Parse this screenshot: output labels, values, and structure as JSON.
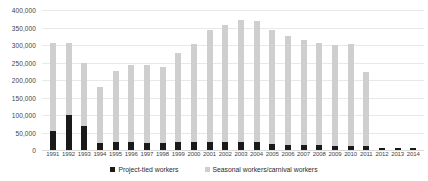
{
  "chart_data": {
    "type": "bar",
    "subtype": "stacked-column",
    "title": "",
    "subtitle": "",
    "xlabel": "",
    "ylabel": "",
    "ylim": [
      0,
      400000
    ],
    "ytick_step": 50000,
    "grid": true,
    "legend_position": "bottom",
    "categories": [
      "1991",
      "1992",
      "1993",
      "1994",
      "1995",
      "1996",
      "1997",
      "1998",
      "1999",
      "2000",
      "2001",
      "2002",
      "2003",
      "2004",
      "2005",
      "2006",
      "2007",
      "2008",
      "2009",
      "2010",
      "2011",
      "2012",
      "2013",
      "2014"
    ],
    "ytick_labels": [
      "400,000",
      "350,000",
      "300,000",
      "250,000",
      "200,000",
      "150,000",
      "100,000",
      "50,000",
      "0"
    ],
    "ytick_values": [
      400000,
      350000,
      300000,
      250000,
      200000,
      150000,
      100000,
      50000,
      0
    ],
    "series": [
      {
        "name": "Project-tied workers",
        "color": "#1a1a1a",
        "values": [
          53000,
          100000,
          70000,
          20000,
          22000,
          22000,
          21000,
          21000,
          22000,
          24000,
          24000,
          24000,
          24000,
          23000,
          18000,
          15000,
          14000,
          13000,
          12000,
          12000,
          11000,
          7000,
          6000,
          5000
        ]
      },
      {
        "name": "Seasonal workers/carnival workers",
        "color": "#cfcfcf",
        "values": [
          252000,
          205000,
          180000,
          160000,
          205000,
          222000,
          222000,
          215000,
          255000,
          280000,
          320000,
          332000,
          348000,
          345000,
          325000,
          310000,
          300000,
          292000,
          288000,
          292000,
          213000,
          0,
          0,
          0
        ]
      }
    ],
    "totals": [
      305000,
      305000,
      250000,
      180000,
      227000,
      244000,
      243000,
      236000,
      277000,
      304000,
      344000,
      356000,
      372000,
      368000,
      343000,
      325000,
      314000,
      305000,
      300000,
      304000,
      224000,
      7000,
      6000,
      5000
    ]
  },
  "legend": {
    "items": [
      {
        "label": "Project-tied workers",
        "color": "#1a1a1a"
      },
      {
        "label": "Seasonal workers/carnival workers",
        "color": "#cfcfcf"
      }
    ]
  }
}
